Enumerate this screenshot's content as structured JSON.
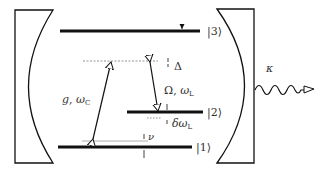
{
  "diagram": {
    "type": "three-level atom in optical cavity (energy level diagram)",
    "levels": [
      {
        "id": "level-3",
        "label": "|3⟩"
      },
      {
        "id": "level-2",
        "label": "|2⟩"
      },
      {
        "id": "level-1",
        "label": "|1⟩"
      }
    ],
    "transitions": {
      "cavity": {
        "label_main": "g",
        "label_sep": ", ",
        "label_omega": "ω",
        "label_sub": "C"
      },
      "laser": {
        "label_main": "Ω",
        "label_sep": ", ",
        "label_omega": "ω",
        "label_sub": "L"
      }
    },
    "detunings": {
      "delta": "Δ",
      "delta_omega_prefix": "δω",
      "delta_omega_sub": "L",
      "nu": "ν"
    },
    "decay": {
      "label": "κ"
    },
    "colors": {
      "line": "#111111",
      "text": "#333333",
      "virtual_level": "#777777",
      "offset_line": "#999999"
    }
  }
}
